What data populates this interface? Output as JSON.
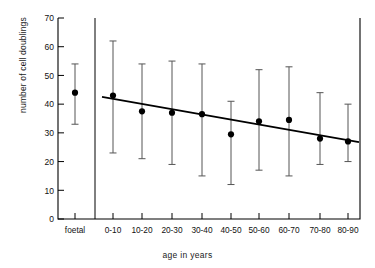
{
  "chart_data": {
    "type": "scatter",
    "title": "",
    "xlabel": "age in years",
    "ylabel": "number of cell doublings",
    "ylim": [
      0,
      70
    ],
    "ytick_values": [
      0,
      10,
      20,
      30,
      40,
      50,
      60,
      70
    ],
    "ytick_labels": [
      "0",
      "10",
      "20",
      "30",
      "40",
      "50",
      "60",
      "70"
    ],
    "grid": false,
    "legend": "none",
    "error_bar_style": "vertical line with end caps",
    "marker": "filled circle",
    "categories": [
      "foetal",
      "0-10",
      "10-20",
      "20-30",
      "30-40",
      "40-50",
      "50-60",
      "60-70",
      "70-80",
      "80-90"
    ],
    "values": [
      44,
      43,
      37.5,
      37,
      36.5,
      29.5,
      34,
      34.5,
      28,
      27
    ],
    "error_low": [
      33,
      23,
      21,
      19,
      15,
      12,
      17,
      15,
      19,
      20
    ],
    "error_high": [
      54,
      62,
      54,
      55,
      54,
      41,
      52,
      53,
      44,
      40
    ],
    "points": [
      {
        "category": "foetal",
        "value": 44,
        "low": 33,
        "high": 54,
        "group": "foetal"
      },
      {
        "category": "0-10",
        "value": 43,
        "low": 23,
        "high": 62,
        "group": "age"
      },
      {
        "category": "10-20",
        "value": 37.5,
        "low": 21,
        "high": 54,
        "group": "age"
      },
      {
        "category": "20-30",
        "value": 37,
        "low": 19,
        "high": 55,
        "group": "age"
      },
      {
        "category": "30-40",
        "value": 36.5,
        "low": 15,
        "high": 54,
        "group": "age"
      },
      {
        "category": "40-50",
        "value": 29.5,
        "low": 12,
        "high": 41,
        "group": "age"
      },
      {
        "category": "50-60",
        "value": 34,
        "low": 17,
        "high": 52,
        "group": "age"
      },
      {
        "category": "60-70",
        "value": 34.5,
        "low": 15,
        "high": 53,
        "group": "age"
      },
      {
        "category": "70-80",
        "value": 28,
        "low": 19,
        "high": 44,
        "group": "age"
      },
      {
        "category": "80-90",
        "value": 27,
        "low": 20,
        "high": 40,
        "group": "age"
      }
    ],
    "trendline": {
      "description": "linear regression over age groups",
      "x_start_category": "0-10",
      "x_end_category": "80-90",
      "y_start": 42.5,
      "y_end": 26.8
    },
    "divider": {
      "after_category": "foetal",
      "description": "vertical rule separating foetal sample from age groups"
    },
    "colors": {
      "axis": "#000000",
      "marker": "#000000",
      "errorbar": "#555555",
      "trendline": "#000000",
      "background": "#ffffff"
    }
  }
}
